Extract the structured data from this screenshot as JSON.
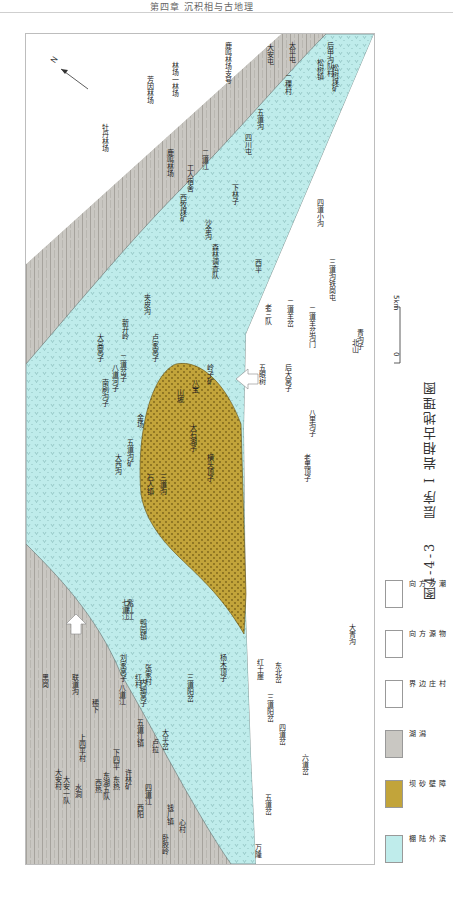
{
  "page_header": "第四章 沉积相与古地理",
  "caption": {
    "figure_number": "图4-4-3",
    "title": "层序 I 岩相古地理图"
  },
  "scale": {
    "zero": "0",
    "length": "5km"
  },
  "compass": {
    "label": "N"
  },
  "legend": [
    {
      "label": "滨外陆棚",
      "color": "#bfeceb",
      "pattern": "v-dots"
    },
    {
      "label": "障壁砂坝",
      "color": "#c2a43a",
      "pattern": "dots"
    },
    {
      "label": "潟湖",
      "color": "#c9c7c2",
      "pattern": "vertical-lines"
    },
    {
      "label": "村庄边界",
      "color": "#ffffff",
      "pattern": "outline"
    },
    {
      "label": "物源方向",
      "color": "#ffffff",
      "pattern": "arrow"
    },
    {
      "label": "潮汐方向",
      "color": "#ffffff",
      "pattern": "arrow-outline"
    }
  ],
  "colors": {
    "offshore_shelf": "#bfeceb",
    "barrier_bar": "#c2a43a",
    "lagoon": "#c9c7c2",
    "frame": "#bdbdbd"
  },
  "places": {
    "lagoon": [
      "鹿鸣林场支号",
      "芳因林场",
      "林场一林场",
      "牡丹林场",
      "西热",
      "水源",
      "东湖五队",
      "东热",
      "大安村",
      "大安一队",
      "水洞",
      "上四平村",
      "稀下",
      "联道沟",
      "黑岗",
      "下四平",
      "刘家窝子",
      "八道江",
      "红村",
      "内细窝子",
      "张家村",
      "南坑屯",
      "五道江镇",
      "许林矿",
      "卢拉",
      "龙口",
      "西阳",
      "四道江",
      "钱厂镇",
      "心村",
      "卧胶岭",
      "万隆",
      "紫红江"
    ],
    "shelf": [
      "大安屯",
      "太平屯",
      "二棵村",
      "松树镇",
      "后甲沟队村",
      "松树煤矿",
      "四川屯",
      "五道沟",
      "下林子",
      "森林调查队",
      "沙金沟",
      "西牧煤矿",
      "工人宿舍",
      "鹿鸣林场",
      "二道江",
      "七道江",
      "鸭园镇",
      "三道阳岔",
      "杨木顶子",
      "三道沟",
      "大平岔",
      "八道河子",
      "新开岭",
      "二道岔子",
      "夹皮沟",
      "卢家窝子",
      "大高窝子",
      "南刷沟子",
      "金场",
      "山坡",
      "八宝",
      "岭子矿",
      "五道沟矿",
      "大西沟"
    ],
    "barrier": [
      "石人镇",
      "大石湖子",
      "横头顶子"
    ],
    "outside": [
      "西平",
      "老三队",
      "二道羊岔",
      "二道羊岔沟门",
      "三道沟铁岗屯",
      "五眼树",
      "后大窝子",
      "八里沟子",
      "老黑顶子",
      "北山",
      "青沟子",
      "四道小沟",
      "红土崖",
      "东北岔",
      "三道阳岔",
      "四道岔",
      "六道岔",
      "五道岔",
      "大青沟",
      "万隆"
    ]
  }
}
